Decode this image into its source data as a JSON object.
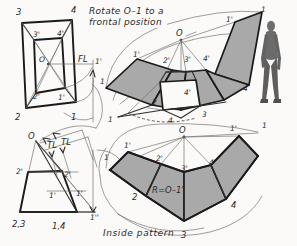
{
  "figure": {
    "title_note": "Rotate O–1 to a frontal position",
    "caption": "Inside pattern",
    "annotations": {
      "fold_line": "FL",
      "true_length_1": "TL",
      "true_length_2": "TL",
      "radius": "R=O–1'"
    }
  },
  "top_view": {
    "name": "top-view-pyramid",
    "labels": {
      "corner_3": "3",
      "corner_4": "4",
      "corner_2": "2",
      "corner_1": "1",
      "inner_3p": "3'",
      "inner_4p": "4'",
      "inner_2p": "2'",
      "inner_1p": "1'",
      "apex_o": "O",
      "rotated_1p": "1'"
    }
  },
  "front_view": {
    "name": "front-view-pyramid",
    "labels": {
      "apex_o": "O",
      "left_2p": "2'",
      "inner_1p": "1'",
      "mid_2p": "2'",
      "mid_1p": "1'",
      "base_left": "2,3",
      "base_right": "1,4",
      "rotated_1pp": "1''",
      "tl_left": "TL",
      "tl_right": "TL"
    }
  },
  "pictorial": {
    "name": "pictorial-partial-development",
    "labels": {
      "apex_o": "O",
      "p1_left": "1'",
      "p1_far_left": "1",
      "p2p": "2'",
      "p3p": "3'",
      "p4p": "4'",
      "p4pp": "4'",
      "p2": "2",
      "p3": "3",
      "p4": "4",
      "p1_right": "1'",
      "p1_far_right": "1"
    }
  },
  "pattern": {
    "name": "inside-pattern-development",
    "labels": {
      "apex_o": "O",
      "seam_left_1p": "1'",
      "seam_left_1": "1",
      "p2p": "2'",
      "p3p": "3'",
      "p4p": "4'",
      "p2": "2",
      "p3": "3",
      "p4": "4",
      "seam_right_1p": "1'",
      "seam_right_1": "1",
      "radius_note": "R=O–1'"
    }
  },
  "scale_figure": {
    "name": "human-scale-figure"
  },
  "colors": {
    "panel_fill": "#a9a9a9",
    "paper": "#fbfaf8",
    "ink": "#1a1a1a"
  }
}
